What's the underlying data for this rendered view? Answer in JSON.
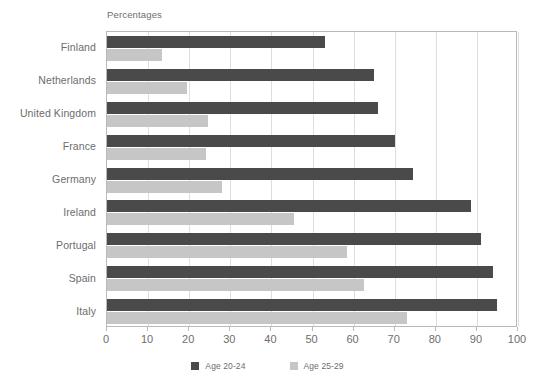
{
  "chart_data": {
    "type": "bar",
    "orientation": "horizontal",
    "title": "Percentages",
    "xlabel": "",
    "ylabel": "",
    "xlim": [
      0,
      100
    ],
    "xticks": [
      0,
      10,
      20,
      30,
      40,
      50,
      60,
      70,
      80,
      90,
      100
    ],
    "xtick_labels": [
      "0",
      "10",
      "20",
      "30",
      "40",
      "50",
      "60",
      "70",
      "80",
      "90",
      "100"
    ],
    "grid": true,
    "grid_axis": "x",
    "legend_position": "bottom-center",
    "categories": [
      "Finland",
      "Netherlands",
      "United Kingdom",
      "France",
      "Germany",
      "Ireland",
      "Portugal",
      "Spain",
      "Italy"
    ],
    "series": [
      {
        "name": "Age 20-24",
        "color": "#4a4a4a",
        "values": [
          53,
          65,
          66,
          70,
          74.5,
          88.5,
          91,
          94,
          95
        ]
      },
      {
        "name": "Age 25-29",
        "color": "#c6c6c6",
        "values": [
          13.5,
          19.5,
          24.5,
          24,
          28,
          45.5,
          58.5,
          62.5,
          73
        ]
      }
    ]
  },
  "axis_colors": {
    "frame": "#b9b9b9",
    "grid": "#dedede",
    "text": "#6d6d6d"
  }
}
